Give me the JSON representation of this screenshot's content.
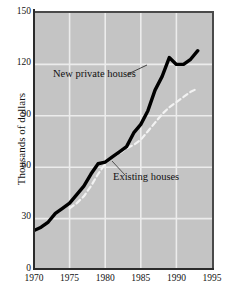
{
  "chart_data": {
    "type": "line",
    "title": "",
    "xlabel": "",
    "ylabel": "Thousands of dollars",
    "xlim": [
      1970,
      1995
    ],
    "ylim": [
      0,
      150
    ],
    "grid": true,
    "legend_position": "inline-annotations",
    "background_color": "#c4c4c4",
    "xticks": [
      "1970",
      "1975",
      "1980",
      "1985",
      "1990",
      "1995"
    ],
    "yticks": [
      "0",
      "30",
      "60",
      "90",
      "120",
      "150"
    ],
    "series": [
      {
        "name": "New private houses",
        "color": "#000000",
        "style": "solid",
        "x": [
          1970,
          1971,
          1972,
          1973,
          1974,
          1975,
          1976,
          1977,
          1978,
          1979,
          1980,
          1981,
          1982,
          1983,
          1984,
          1985,
          1986,
          1987,
          1988,
          1989,
          1990,
          1991,
          1992,
          1993
        ],
        "values": [
          23,
          25,
          28,
          33,
          36,
          39,
          44,
          49,
          56,
          62,
          63,
          66,
          69,
          72,
          80,
          85,
          93,
          105,
          113,
          124,
          120,
          120,
          123,
          128
        ]
      },
      {
        "name": "Existing houses",
        "color": "#f2f2f2",
        "style": "dashed",
        "x": [
          1975,
          1976,
          1977,
          1978,
          1979,
          1980,
          1981,
          1982,
          1983,
          1984,
          1985,
          1986,
          1987,
          1988,
          1989,
          1990,
          1991,
          1992,
          1993
        ],
        "values": [
          36,
          39,
          43,
          49,
          56,
          62,
          66,
          68,
          71,
          73,
          76,
          81,
          86,
          91,
          95,
          98,
          101,
          104,
          106
        ]
      }
    ],
    "annotations": [
      {
        "text": "New private houses",
        "series": "New private houses"
      },
      {
        "text": "Existing houses",
        "series": "Existing houses"
      }
    ]
  },
  "axis": {
    "y_title": "Thousands of dollars",
    "y_ticks": [
      "150",
      "120",
      "90",
      "60",
      "30",
      "0"
    ],
    "x_ticks": [
      "1970",
      "1975",
      "1980",
      "1985",
      "1990",
      "1995"
    ]
  },
  "labels": {
    "new_private_houses": "New private houses",
    "existing_houses": "Existing houses"
  }
}
